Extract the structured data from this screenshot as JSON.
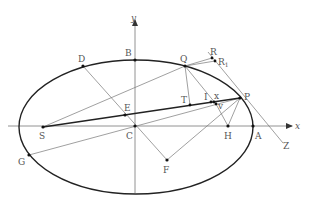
{
  "diagram": {
    "colors": {
      "curve": "#222222",
      "line": "#777777",
      "bold_line": "#222222",
      "label": "#555555",
      "point": "#111111"
    },
    "axes": {
      "x_label": "x",
      "y_label": "y"
    },
    "labels": {
      "B": "B",
      "D": "D",
      "Q": "Q",
      "R": "R",
      "R1": "R",
      "R1_sub": "1",
      "T": "T",
      "I": "I",
      "x": "x",
      "v": "v",
      "P": "P",
      "E": "E",
      "S": "S",
      "C": "C",
      "H": "H",
      "A": "A",
      "Z": "Z",
      "G": "G",
      "F": "F"
    }
  }
}
